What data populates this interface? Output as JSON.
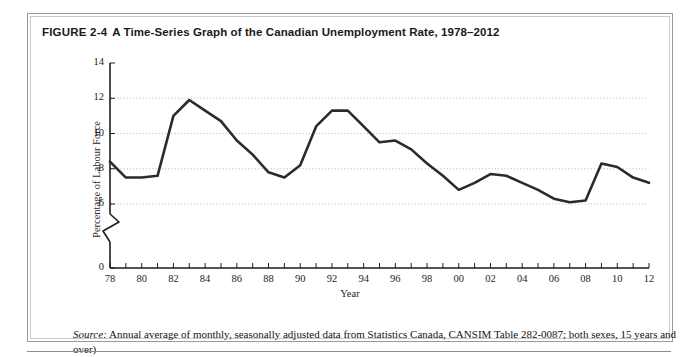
{
  "figure": {
    "label": "FIGURE 2-4",
    "caption": "A Time-Series Graph of the Canadian Unemployment Rate, 1978–2012",
    "source_word": "Source:",
    "source_text": " Annual average of monthly, seasonally adjusted data from Statistics Canada, CANSIM Table 282-0087; both sexes, 15 years and over)"
  },
  "colors": {
    "line": "#2b2b2b",
    "axis": "#1d1d1d",
    "grid": "#b9b9b9",
    "frame_outer": "#9a9a9a",
    "frame_inner": "#c9c9c9",
    "background": "#ffffff",
    "text": "#1d1d1d"
  },
  "chart_data": {
    "type": "line",
    "title": "A Time-Series Graph of the Canadian Unemployment Rate, 1978–2012",
    "xlabel": "Year",
    "ylabel": "Percentage of Labour Force",
    "xlim": [
      1978,
      2012
    ],
    "ylim": [
      6,
      14
    ],
    "y_axis_break": true,
    "y_break_between": [
      0,
      6
    ],
    "yticks": [
      0,
      6,
      8,
      10,
      12,
      14
    ],
    "ytick_labels": [
      "0",
      "6",
      "8",
      "10",
      "12",
      "14"
    ],
    "gridlines_y": [
      6,
      8,
      10,
      12
    ],
    "grid": true,
    "grid_style": "dotted",
    "legend": null,
    "xticks": [
      1978,
      1980,
      1982,
      1984,
      1986,
      1988,
      1990,
      1992,
      1994,
      1996,
      1998,
      2000,
      2002,
      2004,
      2006,
      2008,
      2010,
      2012
    ],
    "xtick_labels": [
      "78",
      "80",
      "82",
      "84",
      "86",
      "88",
      "90",
      "92",
      "94",
      "96",
      "98",
      "00",
      "02",
      "04",
      "06",
      "08",
      "10",
      "12"
    ],
    "x": [
      1978,
      1979,
      1980,
      1981,
      1982,
      1983,
      1984,
      1985,
      1986,
      1987,
      1988,
      1989,
      1990,
      1991,
      1992,
      1993,
      1994,
      1995,
      1996,
      1997,
      1998,
      1999,
      2000,
      2001,
      2002,
      2003,
      2004,
      2005,
      2006,
      2007,
      2008,
      2009,
      2010,
      2011,
      2012
    ],
    "values": [
      8.4,
      7.5,
      7.5,
      7.6,
      11.0,
      11.9,
      11.3,
      10.7,
      9.6,
      8.8,
      7.8,
      7.5,
      8.2,
      10.4,
      11.3,
      11.3,
      10.4,
      9.5,
      9.6,
      9.1,
      8.3,
      7.6,
      6.8,
      7.2,
      7.7,
      7.6,
      7.2,
      6.8,
      6.3,
      6.1,
      6.2,
      8.3,
      8.1,
      7.5,
      7.2
    ],
    "series_name": "Canadian Unemployment Rate"
  }
}
